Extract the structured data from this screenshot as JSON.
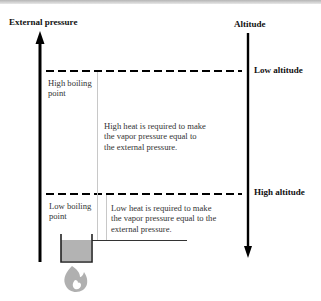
{
  "axes": {
    "left_label": "External pressure",
    "right_label": "Altitude"
  },
  "levels": {
    "low_altitude": "Low altitude",
    "high_altitude": "High altitude"
  },
  "boxes": {
    "high_boiling": {
      "line1": "High boiling",
      "line2": "point"
    },
    "low_boiling": {
      "line1": "Low boiling",
      "line2": "point"
    }
  },
  "notes": {
    "high_heat": [
      "High heat is required to make",
      "the vapor pressure equal to",
      "the external pressure."
    ],
    "low_heat": [
      "Low heat is required to make",
      "the vapor pressure equal to the",
      "external pressure."
    ]
  },
  "icons": {
    "beaker": "beaker-icon",
    "flame": "flame-icon"
  },
  "colors": {
    "line": "#000000",
    "separator": "#c8c8c8",
    "liquid": "#b3b3b3",
    "flame": "#b0b0b0"
  }
}
